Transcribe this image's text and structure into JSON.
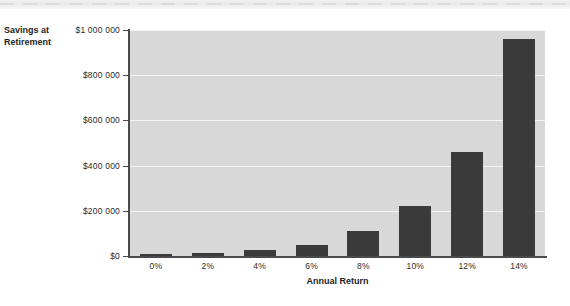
{
  "chart_data": {
    "type": "bar",
    "title": "",
    "xlabel": "Annual Return",
    "ylabel": "Savings at Retirement",
    "categories": [
      "0%",
      "2%",
      "4%",
      "6%",
      "8%",
      "10%",
      "12%",
      "14%"
    ],
    "values": [
      5000,
      12000,
      25000,
      50000,
      110000,
      220000,
      460000,
      960000
    ],
    "ylim": [
      0,
      1000000
    ],
    "ytick_values": [
      0,
      200000,
      400000,
      600000,
      800000,
      1000000
    ],
    "ytick_labels": [
      "$0",
      "$200 000",
      "$400 000",
      "$600 000",
      "$800 000",
      "$1 000 000"
    ],
    "grid": "horizontal",
    "legend": "none",
    "bar_color": "#3a3a3a",
    "plot_background": "#d8d8d8",
    "gridline_color": "#f4f4f4"
  },
  "axes": {
    "y_title_line1": "Savings at",
    "y_title_line2": "Retirement",
    "x_title": "Annual Return"
  }
}
